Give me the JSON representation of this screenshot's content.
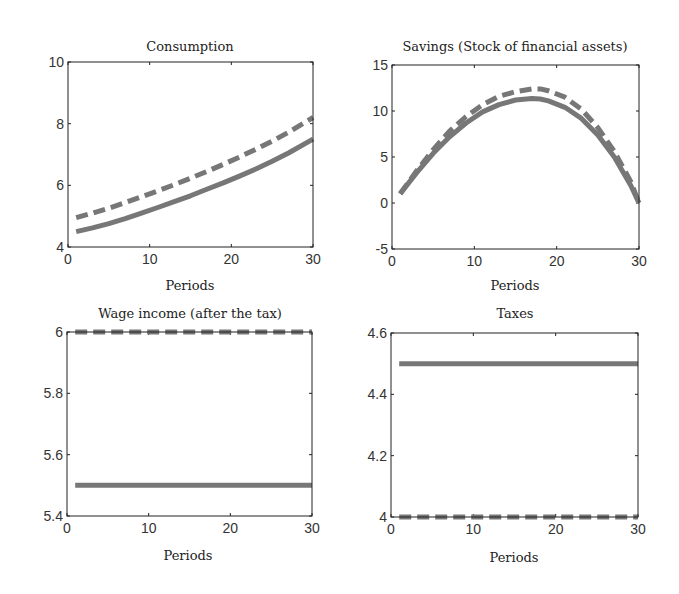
{
  "figure": {
    "background": "#ffffff",
    "line_color": "#777777",
    "axes_color": "#222222"
  },
  "chart_data": [
    {
      "type": "line",
      "title": "Consumption",
      "xlabel": "Periods",
      "ylabel": "",
      "xlim": [
        0,
        30
      ],
      "ylim": [
        4,
        10
      ],
      "xticks": [
        0,
        10,
        20,
        30
      ],
      "yticks": [
        4,
        6,
        8,
        10
      ],
      "ytick_labels": [
        "4",
        "6",
        "8",
        "10"
      ],
      "box": {
        "left": 68,
        "top": 62,
        "right": 313,
        "bottom": 247
      },
      "x": [
        1,
        3,
        5,
        7,
        9,
        11,
        13,
        15,
        17,
        19,
        21,
        23,
        25,
        27,
        30
      ],
      "series": [
        {
          "name": "solid",
          "style": "solid",
          "values": [
            4.5,
            4.62,
            4.76,
            4.92,
            5.1,
            5.28,
            5.47,
            5.66,
            5.87,
            6.08,
            6.3,
            6.53,
            6.78,
            7.05,
            7.5
          ]
        },
        {
          "name": "dashed",
          "style": "dashed",
          "values": [
            4.95,
            5.1,
            5.26,
            5.44,
            5.63,
            5.82,
            6.02,
            6.23,
            6.45,
            6.68,
            6.92,
            7.17,
            7.43,
            7.72,
            8.2
          ]
        }
      ]
    },
    {
      "type": "line",
      "title": "Savings (Stock of financial assets)",
      "xlabel": "Periods",
      "ylabel": "",
      "xlim": [
        0,
        30
      ],
      "ylim": [
        -5,
        15
      ],
      "xticks": [
        0,
        10,
        20,
        30
      ],
      "yticks": [
        -5,
        0,
        5,
        10,
        15
      ],
      "ytick_labels": [
        "-5",
        "0",
        "5",
        "10",
        "15"
      ],
      "box": {
        "left": 392,
        "top": 65,
        "right": 639,
        "bottom": 249
      },
      "x": [
        1,
        3,
        5,
        7,
        9,
        11,
        13,
        15,
        17,
        18,
        19,
        21,
        23,
        25,
        27,
        29,
        30
      ],
      "series": [
        {
          "name": "solid",
          "style": "solid",
          "values": [
            1.0,
            3.3,
            5.4,
            7.2,
            8.7,
            9.9,
            10.7,
            11.2,
            11.35,
            11.3,
            11.1,
            10.4,
            9.2,
            7.4,
            5.0,
            1.9,
            0.0
          ]
        },
        {
          "name": "dashed",
          "style": "dashed",
          "values": [
            1.0,
            3.5,
            5.8,
            7.8,
            9.4,
            10.7,
            11.6,
            12.1,
            12.4,
            12.4,
            12.2,
            11.5,
            10.2,
            8.2,
            5.6,
            2.3,
            0.0
          ]
        }
      ]
    },
    {
      "type": "line",
      "title": "Wage income (after the tax)",
      "xlabel": "Periods",
      "ylabel": "",
      "xlim": [
        0,
        30
      ],
      "ylim": [
        5.4,
        6
      ],
      "xticks": [
        0,
        10,
        20,
        30
      ],
      "yticks": [
        5.4,
        5.6,
        5.8,
        6
      ],
      "ytick_labels": [
        "5.4",
        "5.6",
        "5.8",
        "6"
      ],
      "box": {
        "left": 67,
        "top": 332,
        "right": 312,
        "bottom": 516
      },
      "x": [
        1,
        30
      ],
      "series": [
        {
          "name": "solid",
          "style": "solid",
          "values": [
            5.5,
            5.5
          ]
        },
        {
          "name": "dashed",
          "style": "dashed",
          "values": [
            6.0,
            6.0
          ]
        }
      ]
    },
    {
      "type": "line",
      "title": "Taxes",
      "xlabel": "Periods",
      "ylabel": "",
      "xlim": [
        0,
        30
      ],
      "ylim": [
        4,
        4.6
      ],
      "xticks": [
        0,
        10,
        20,
        30
      ],
      "yticks": [
        4,
        4.2,
        4.4,
        4.6
      ],
      "ytick_labels": [
        "4",
        "4.2",
        "4.4",
        "4.6"
      ],
      "box": {
        "left": 391,
        "top": 333,
        "right": 638,
        "bottom": 517
      },
      "x": [
        1,
        30
      ],
      "series": [
        {
          "name": "solid",
          "style": "solid",
          "values": [
            4.5,
            4.5
          ]
        },
        {
          "name": "dashed",
          "style": "dashed",
          "values": [
            4.0,
            4.0
          ]
        }
      ]
    }
  ]
}
